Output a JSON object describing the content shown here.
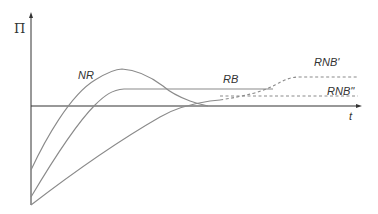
{
  "diagram": {
    "axes": {
      "y_label": "Π",
      "x_label": "t"
    },
    "curves": [
      {
        "id": "NR",
        "label": "NR",
        "style": "solid"
      },
      {
        "id": "RB",
        "label": "RB",
        "style": "solid"
      },
      {
        "id": "RNB_prime",
        "label": "RNB'",
        "style": "dashed"
      },
      {
        "id": "RNB_double_prime",
        "label": "RNB''",
        "style": "dashed"
      }
    ],
    "colors": {
      "axis": "#333333",
      "curve": "#8a8a8a",
      "text": "#333333"
    }
  }
}
